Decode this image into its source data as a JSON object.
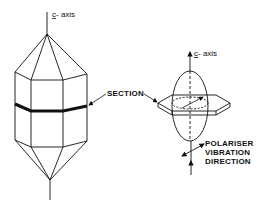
{
  "figure": {
    "left_crystal": {
      "axis_label_prefix": "c",
      "axis_label_suffix": "- axis",
      "description": "hexagonal prism crystal with pyramidal terminations"
    },
    "right_indicatrix": {
      "axis_label_prefix": "c",
      "axis_label_suffix": "- axis",
      "description": "uniaxial indicatrix ellipsoid with section plate"
    },
    "section_label": "SECTION",
    "polariser_label": [
      "POLARISER",
      "VIBRATION",
      "DIRECTION"
    ],
    "colors": {
      "line": "#111111",
      "background": "#ffffff"
    }
  }
}
